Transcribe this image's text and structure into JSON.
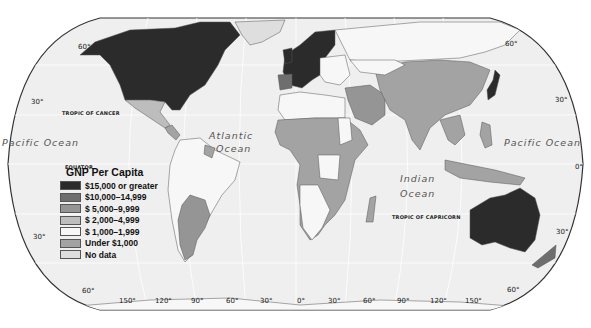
{
  "map": {
    "title": "GNP Per Capita",
    "projection": "Robinson-like world map",
    "colors": {
      "ocean": "#efefef",
      "grid": "#ffffff",
      "border": "#555555",
      "outline": "#333333"
    },
    "legend": {
      "title": "GNP Per Capita",
      "items": [
        {
          "label": "$15,000 or greater",
          "color": "#2b2b2b"
        },
        {
          "label": "$10,000–14,999",
          "color": "#6e6e6e"
        },
        {
          "label": "$ 5,000–9,999",
          "color": "#959595"
        },
        {
          "label": "$ 2,000–4,999",
          "color": "#bdbdbd"
        },
        {
          "label": "$ 1,000–1,999",
          "color": "#f7f7f7"
        },
        {
          "label": "Under $1,000",
          "color": "#a3a3a3"
        },
        {
          "label": "No data",
          "color": "#dedede"
        }
      ]
    },
    "ocean_labels": {
      "pacific_west": "Pacific Ocean",
      "atlantic_1": "Atlantic",
      "atlantic_2": "Ocean",
      "indian_1": "Indian",
      "indian_2": "Ocean",
      "pacific_east": "Pacific Ocean"
    },
    "line_labels": {
      "tropic_cancer": "TROPIC OF CANCER",
      "equator": "EQUATOR",
      "tropic_capricorn": "TROPIC OF CAPRICORN"
    },
    "latitude_labels": {
      "left_60n": "60°",
      "left_30n": "30°",
      "left_30s": "30°",
      "left_60s": "60°",
      "right_60n": "60°",
      "right_30n": "30°",
      "right_0": "0°",
      "right_30s": "30°",
      "right_60s": "60°"
    },
    "longitude_labels": [
      "150°",
      "120°",
      "90°",
      "60°",
      "30°",
      "0°",
      "30°",
      "60°",
      "90°",
      "120°",
      "150°"
    ]
  }
}
